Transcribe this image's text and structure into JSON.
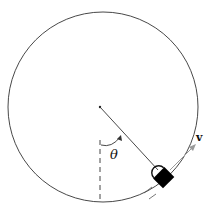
{
  "diagram": {
    "labels": {
      "angle": "θ",
      "velocity": "v"
    },
    "colors": {
      "stroke": "#333333",
      "block": "#000000",
      "velocity_arrow": "#9a9a9a",
      "background": "#ffffff"
    },
    "elements": [
      "circular-track",
      "center-point",
      "vertical-dashed-reference-line",
      "radius-line",
      "angle-arc-theta",
      "block-on-track",
      "velocity-vector"
    ]
  }
}
